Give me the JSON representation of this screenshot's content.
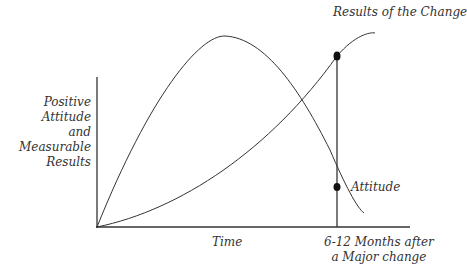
{
  "diagram": {
    "y_axis_label": [
      "Positive",
      "Attitude",
      "and",
      "Measurable",
      "Results"
    ],
    "x_axis_label": "Time",
    "marker_label": [
      "6-12 Months after",
      "a Major change"
    ],
    "curve_results_label": "Results of the Change",
    "curve_attitude_label": "Attitude",
    "line_color": "#333333",
    "dot_color": "#111111"
  }
}
